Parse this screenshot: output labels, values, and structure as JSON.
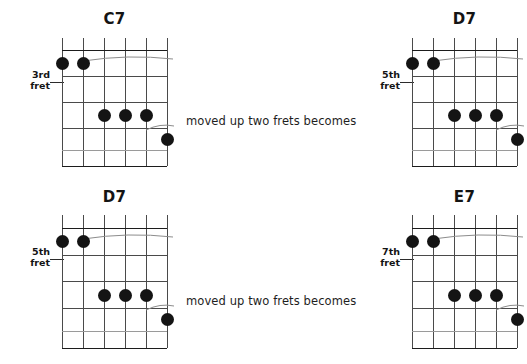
{
  "page": {
    "background_color": "#ffffff",
    "ink_color": "#141414",
    "grid_line_color": "#4a4a4a"
  },
  "connectors": [
    {
      "text": "moved up two frets becomes"
    },
    {
      "text": "moved up two frets becomes"
    }
  ],
  "diagrams": [
    {
      "id": "chord-c7",
      "title": "C7",
      "fret_label_line1": "3rd",
      "fret_label_line2": "fret",
      "strings": 6,
      "frets": 5,
      "dots": [
        {
          "string": 1,
          "fret": 1
        },
        {
          "string": 2,
          "fret": 1
        },
        {
          "string": 3,
          "fret": 3
        },
        {
          "string": 4,
          "fret": 3
        },
        {
          "string": 5,
          "fret": 3
        },
        {
          "string": 6,
          "fret": 4
        }
      ],
      "barres": [
        {
          "fret": 1,
          "from_string": 2,
          "to_string": 6
        },
        {
          "fret": 3,
          "from_string": 5,
          "to_string": 6
        }
      ]
    },
    {
      "id": "chord-d7-top",
      "title": "D7",
      "fret_label_line1": "5th",
      "fret_label_line2": "fret",
      "strings": 6,
      "frets": 5,
      "dots": [
        {
          "string": 1,
          "fret": 1
        },
        {
          "string": 2,
          "fret": 1
        },
        {
          "string": 3,
          "fret": 3
        },
        {
          "string": 4,
          "fret": 3
        },
        {
          "string": 5,
          "fret": 3
        },
        {
          "string": 6,
          "fret": 4
        }
      ],
      "barres": [
        {
          "fret": 1,
          "from_string": 2,
          "to_string": 6
        },
        {
          "fret": 3,
          "from_string": 5,
          "to_string": 6
        }
      ]
    },
    {
      "id": "chord-d7-bottom",
      "title": "D7",
      "fret_label_line1": "5th",
      "fret_label_line2": "fret",
      "strings": 6,
      "frets": 5,
      "dots": [
        {
          "string": 1,
          "fret": 1
        },
        {
          "string": 2,
          "fret": 1
        },
        {
          "string": 3,
          "fret": 3
        },
        {
          "string": 4,
          "fret": 3
        },
        {
          "string": 5,
          "fret": 3
        },
        {
          "string": 6,
          "fret": 4
        }
      ],
      "barres": [
        {
          "fret": 1,
          "from_string": 2,
          "to_string": 6
        },
        {
          "fret": 3,
          "from_string": 5,
          "to_string": 6
        }
      ]
    },
    {
      "id": "chord-e7",
      "title": "E7",
      "fret_label_line1": "7th",
      "fret_label_line2": "fret",
      "strings": 6,
      "frets": 5,
      "dots": [
        {
          "string": 1,
          "fret": 1
        },
        {
          "string": 2,
          "fret": 1
        },
        {
          "string": 3,
          "fret": 3
        },
        {
          "string": 4,
          "fret": 3
        },
        {
          "string": 5,
          "fret": 3
        },
        {
          "string": 6,
          "fret": 4
        }
      ],
      "barres": [
        {
          "fret": 1,
          "from_string": 2,
          "to_string": 6
        },
        {
          "fret": 3,
          "from_string": 5,
          "to_string": 6
        }
      ]
    }
  ]
}
